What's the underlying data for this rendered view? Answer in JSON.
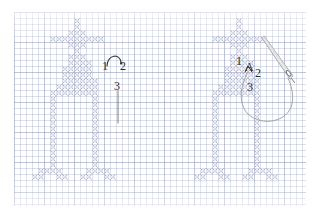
{
  "figure": {
    "type": "embroidery-instruction",
    "background_color": "#ffffff",
    "grid": {
      "visible": true,
      "minor_cell_px": 6,
      "major_cell_px": 30,
      "minor_color": "#7887af",
      "major_color": "#96a0be",
      "left": 14,
      "top": 12,
      "width": 292,
      "height": 194
    },
    "stitch_color": "#b9bed2",
    "stitch_outline_color": "#9aa0bb",
    "ink_color": "#2b2b2b"
  },
  "panels": [
    {
      "id": "left-panel",
      "name": "stitch-order-panel",
      "labels": [
        {
          "id": "l1",
          "text": "1",
          "x": 104,
          "y": 67
        },
        {
          "id": "l2",
          "text": "2",
          "x": 122,
          "y": 67
        },
        {
          "id": "l3",
          "text": "3",
          "x": 116,
          "y": 87
        }
      ],
      "has_needle": false,
      "has_loop": true
    },
    {
      "id": "right-panel",
      "name": "needle-position-panel",
      "labels": [
        {
          "id": "r1",
          "text": "1",
          "x": 238,
          "y": 62
        },
        {
          "id": "rA",
          "text": "A",
          "x": 248,
          "y": 68
        },
        {
          "id": "r2",
          "text": "2",
          "x": 257,
          "y": 74
        },
        {
          "id": "r3",
          "text": "3",
          "x": 249,
          "y": 88
        }
      ],
      "has_needle": true,
      "has_loop": true,
      "needle": {
        "name": "sewing-needle",
        "eye_visible": true
      },
      "thread": {
        "name": "thread-loop",
        "color": "#9b9b9b"
      }
    }
  ],
  "chart_data": {
    "type": "heatmap",
    "xlabel": "",
    "ylabel": "",
    "cell_size": 6,
    "legend": [
      "filled = cross stitch"
    ],
    "pattern_name": "standing-figure",
    "grid_cols": 22,
    "grid_rows": 30,
    "filled_cells": [
      [
        10,
        1
      ],
      [
        10,
        2
      ],
      [
        9,
        3
      ],
      [
        10,
        3
      ],
      [
        11,
        3
      ],
      [
        6,
        4
      ],
      [
        7,
        4
      ],
      [
        8,
        4
      ],
      [
        9,
        4
      ],
      [
        10,
        4
      ],
      [
        11,
        4
      ],
      [
        12,
        4
      ],
      [
        13,
        4
      ],
      [
        14,
        4
      ],
      [
        9,
        5
      ],
      [
        10,
        5
      ],
      [
        11,
        5
      ],
      [
        10,
        6
      ],
      [
        9,
        7
      ],
      [
        10,
        7
      ],
      [
        11,
        7
      ],
      [
        9,
        8
      ],
      [
        10,
        8
      ],
      [
        11,
        8
      ],
      [
        12,
        8
      ],
      [
        8,
        9
      ],
      [
        9,
        9
      ],
      [
        10,
        9
      ],
      [
        11,
        9
      ],
      [
        12,
        9
      ],
      [
        8,
        10
      ],
      [
        9,
        10
      ],
      [
        10,
        10
      ],
      [
        11,
        10
      ],
      [
        12,
        10
      ],
      [
        8,
        11
      ],
      [
        9,
        11
      ],
      [
        10,
        11
      ],
      [
        11,
        11
      ],
      [
        12,
        11
      ],
      [
        13,
        11
      ],
      [
        7,
        12
      ],
      [
        8,
        12
      ],
      [
        9,
        12
      ],
      [
        10,
        12
      ],
      [
        11,
        12
      ],
      [
        12,
        12
      ],
      [
        13,
        12
      ],
      [
        6,
        13
      ],
      [
        7,
        13
      ],
      [
        8,
        13
      ],
      [
        9,
        13
      ],
      [
        10,
        13
      ],
      [
        11,
        13
      ],
      [
        12,
        13
      ],
      [
        13,
        13
      ],
      [
        6,
        14
      ],
      [
        13,
        14
      ],
      [
        6,
        15
      ],
      [
        13,
        15
      ],
      [
        6,
        16
      ],
      [
        13,
        16
      ],
      [
        6,
        17
      ],
      [
        13,
        17
      ],
      [
        6,
        18
      ],
      [
        13,
        18
      ],
      [
        6,
        19
      ],
      [
        13,
        19
      ],
      [
        6,
        20
      ],
      [
        13,
        20
      ],
      [
        6,
        21
      ],
      [
        13,
        21
      ],
      [
        6,
        22
      ],
      [
        13,
        22
      ],
      [
        6,
        23
      ],
      [
        13,
        23
      ],
      [
        6,
        24
      ],
      [
        13,
        24
      ],
      [
        6,
        25
      ],
      [
        13,
        25
      ],
      [
        4,
        26
      ],
      [
        5,
        26
      ],
      [
        6,
        26
      ],
      [
        7,
        26
      ],
      [
        12,
        26
      ],
      [
        13,
        26
      ],
      [
        14,
        26
      ],
      [
        15,
        26
      ],
      [
        3,
        27
      ],
      [
        4,
        27
      ],
      [
        7,
        27
      ],
      [
        8,
        27
      ],
      [
        11,
        27
      ],
      [
        12,
        27
      ],
      [
        15,
        27
      ],
      [
        16,
        27
      ]
    ]
  }
}
